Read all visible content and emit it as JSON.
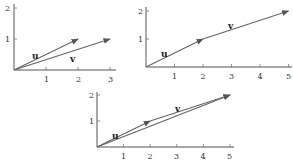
{
  "diagram": {
    "vectors": {
      "u": {
        "label": "u",
        "components": [
          2,
          1
        ]
      },
      "v": {
        "label": "v",
        "components": [
          3,
          1
        ]
      }
    },
    "panels": [
      {
        "id": "panel-1",
        "caption": "u and v drawn from the origin",
        "x_ticks": [
          "1",
          "2",
          "3"
        ],
        "y_ticks": [
          "1",
          "2"
        ],
        "labels": {
          "u": "u",
          "v": "v"
        }
      },
      {
        "id": "panel-2",
        "caption": "v placed head-to-tail after u",
        "x_ticks": [
          "1",
          "2",
          "3",
          "4",
          "5"
        ],
        "y_ticks": [
          "1",
          "2"
        ],
        "labels": {
          "u": "u",
          "v": "v"
        }
      },
      {
        "id": "panel-3",
        "caption": "u + v resultant from origin to (5,2)",
        "x_ticks": [
          "1",
          "2",
          "3",
          "4",
          "5"
        ],
        "y_ticks": [
          "1",
          "2"
        ],
        "labels": {
          "u": "u",
          "v": "v"
        }
      }
    ]
  }
}
